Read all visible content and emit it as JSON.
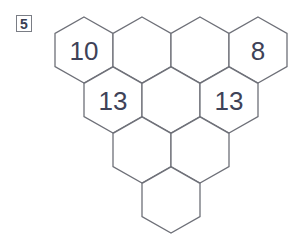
{
  "problem": {
    "number": "5"
  },
  "hexagons": [
    {
      "id": "r1c1",
      "row": 1,
      "cx": 84,
      "cy": 50,
      "value": "10"
    },
    {
      "id": "r1c2",
      "row": 1,
      "cx": 142,
      "cy": 50,
      "value": ""
    },
    {
      "id": "r1c3",
      "row": 1,
      "cx": 200,
      "cy": 50,
      "value": ""
    },
    {
      "id": "r1c4",
      "row": 1,
      "cx": 258,
      "cy": 50,
      "value": "8"
    },
    {
      "id": "r2c1",
      "row": 2,
      "cx": 113,
      "cy": 100,
      "value": "13"
    },
    {
      "id": "r2c2",
      "row": 2,
      "cx": 171,
      "cy": 100,
      "value": ""
    },
    {
      "id": "r2c3",
      "row": 2,
      "cx": 229,
      "cy": 100,
      "value": "13"
    },
    {
      "id": "r3c1",
      "row": 3,
      "cx": 142,
      "cy": 150,
      "value": ""
    },
    {
      "id": "r3c2",
      "row": 3,
      "cx": 200,
      "cy": 150,
      "value": ""
    },
    {
      "id": "r4c1",
      "row": 4,
      "cx": 171,
      "cy": 200,
      "value": ""
    }
  ],
  "style": {
    "stroke": "#6e7078",
    "text": "#3e4258"
  }
}
